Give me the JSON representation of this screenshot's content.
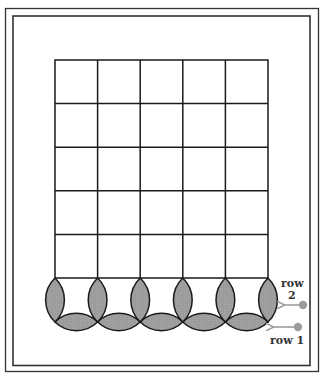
{
  "diagram": {
    "type": "quilt-block-border",
    "grid": {
      "rows": 5,
      "cols": 5
    },
    "labels": {
      "row2_line1": "row",
      "row2_line2": "2",
      "row1": "row 1"
    },
    "colors": {
      "line": "#1a1a1a",
      "petal_fill": "#9a9a9a",
      "arrow": "#9c9c9c",
      "frame": "#333333"
    }
  }
}
